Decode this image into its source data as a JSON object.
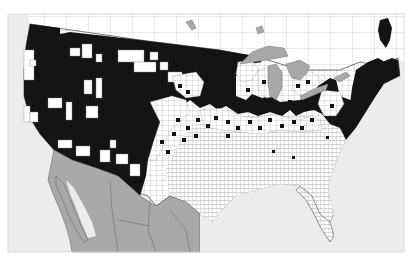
{
  "map": {
    "type": "county-level distribution map",
    "region": "Contiguous United States with southern Canada and northern Mexico",
    "legend": [],
    "colors": {
      "background": "#ffffff",
      "ocean": "#ececec",
      "present_counties": "#141414",
      "absent_counties": "#ffffff",
      "county_borders": "#8a8a8a",
      "great_lakes": "#a8a8a8",
      "mexico": "#a9a9a9",
      "canada": "#ffffff",
      "caribbean": "#9a9a9a"
    },
    "regions_present": [
      "Pacific Northwest",
      "California",
      "Great Basin",
      "Rocky Mountains",
      "Northern Great Plains",
      "Upper Midwest",
      "Great Lakes region",
      "New England",
      "Mid-Atlantic Appalachians"
    ],
    "regions_absent": [
      "Southeast",
      "Gulf Coast",
      "Southern Great Plains",
      "Texas",
      "Florida"
    ]
  }
}
